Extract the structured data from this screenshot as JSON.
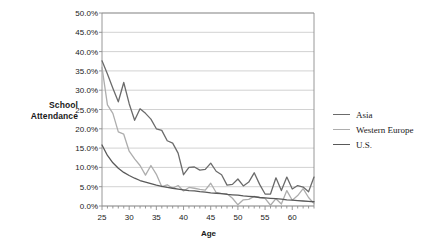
{
  "chart_data": {
    "type": "line",
    "title": "",
    "xlabel": "Age",
    "ylabel": "School Attendance",
    "xlim": [
      25,
      64
    ],
    "ylim": [
      0,
      50
    ],
    "grid": true,
    "legend_position": "right",
    "ytick_labels": [
      "0.0%",
      "5.0%",
      "10.0%",
      "15.0%",
      "20.0%",
      "25.0%",
      "30.0%",
      "35.0%",
      "40.0%",
      "45.0%",
      "50.0%"
    ],
    "ytick_values": [
      0,
      5,
      10,
      15,
      20,
      25,
      30,
      35,
      40,
      45,
      50
    ],
    "xtick_labels": [
      "25",
      "30",
      "35",
      "40",
      "45",
      "50",
      "55",
      "60"
    ],
    "xtick_values": [
      25,
      30,
      35,
      40,
      45,
      50,
      55,
      60
    ],
    "x": [
      25,
      26,
      27,
      28,
      29,
      30,
      31,
      32,
      33,
      34,
      35,
      36,
      37,
      38,
      39,
      40,
      41,
      42,
      43,
      44,
      45,
      46,
      47,
      48,
      49,
      50,
      51,
      52,
      53,
      54,
      55,
      56,
      57,
      58,
      59,
      60,
      61,
      62,
      63,
      64
    ],
    "series": [
      {
        "name": "Asia",
        "color": "#6b6b6b",
        "values": [
          37.6,
          34.2,
          30.5,
          27.0,
          32.0,
          26.5,
          22.2,
          25.2,
          24.0,
          22.5,
          20.0,
          19.6,
          16.9,
          16.3,
          13.7,
          8.1,
          10.0,
          10.1,
          9.3,
          9.5,
          11.1,
          9.0,
          8.1,
          5.4,
          5.6,
          7.0,
          5.2,
          6.2,
          8.6,
          5.6,
          3.1,
          3.1,
          7.3,
          4.0,
          7.5,
          4.4,
          5.3,
          4.9,
          3.7,
          7.5
        ]
      },
      {
        "name": "Western Europe",
        "color": "#adadad",
        "values": [
          35.9,
          26.2,
          24.0,
          19.2,
          18.6,
          14.2,
          12.2,
          10.5,
          8.0,
          10.5,
          8.2,
          5.0,
          5.5,
          4.6,
          5.3,
          3.9,
          4.8,
          4.6,
          4.3,
          4.1,
          5.9,
          3.5,
          3.2,
          3.2,
          2.0,
          0.3,
          1.6,
          1.7,
          2.5,
          2.2,
          2.0,
          0.2,
          1.9,
          0.5,
          4.0,
          1.5,
          2.7,
          4.5,
          2.2,
          0.6
        ]
      },
      {
        "name": "U.S.",
        "color": "#595959",
        "values": [
          15.8,
          13.1,
          11.2,
          9.8,
          8.7,
          7.9,
          7.2,
          6.6,
          6.2,
          5.8,
          5.4,
          5.1,
          4.8,
          4.6,
          4.4,
          4.2,
          4.0,
          3.9,
          3.7,
          3.6,
          3.4,
          3.3,
          3.2,
          3.0,
          2.9,
          2.8,
          2.6,
          2.5,
          2.4,
          2.2,
          2.1,
          2.0,
          1.9,
          1.8,
          1.6,
          1.5,
          1.4,
          1.3,
          1.2,
          1.1
        ]
      }
    ]
  },
  "legend": {
    "items": [
      {
        "label": "Asia"
      },
      {
        "label": "Western Europe"
      },
      {
        "label": "U.S."
      }
    ]
  },
  "axis": {
    "y_title_line1": "School",
    "y_title_line2": "Attendance",
    "x_title": "Age"
  },
  "colors": {
    "plot_border": "#8c8c8c",
    "gridline": "#bfbfbf",
    "text": "#1a1a1a",
    "background": "#ffffff"
  }
}
